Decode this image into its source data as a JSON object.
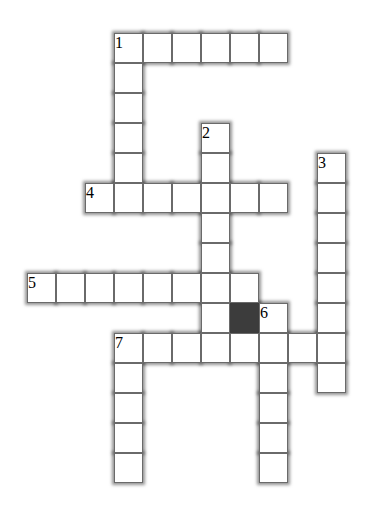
{
  "puzzle": {
    "type": "crossword",
    "cell_width": 29,
    "cell_height": 30,
    "origin_x": 27,
    "origin_y": 33,
    "colors": {
      "cell": "#ffffff",
      "border": "#6a6a6a",
      "block": "#3c3c3c",
      "background": "#ffffff"
    },
    "entries": [
      {
        "number": "1",
        "direction": "across",
        "row": 0,
        "col": 3,
        "length": 6
      },
      {
        "number": "1",
        "direction": "down",
        "row": 0,
        "col": 3,
        "length": 6
      },
      {
        "number": "2",
        "direction": "down",
        "row": 3,
        "col": 6,
        "length": 8
      },
      {
        "number": "3",
        "direction": "down",
        "row": 4,
        "col": 10,
        "length": 8
      },
      {
        "number": "4",
        "direction": "across",
        "row": 5,
        "col": 2,
        "length": 7
      },
      {
        "number": "5",
        "direction": "across",
        "row": 8,
        "col": 0,
        "length": 8
      },
      {
        "number": "6",
        "direction": "down",
        "row": 9,
        "col": 8,
        "length": 6
      },
      {
        "number": "7",
        "direction": "across",
        "row": 10,
        "col": 3,
        "length": 8
      },
      {
        "number": "7",
        "direction": "down",
        "row": 10,
        "col": 3,
        "length": 5
      }
    ],
    "blocks": [
      {
        "row": 9,
        "col": 7
      }
    ]
  }
}
